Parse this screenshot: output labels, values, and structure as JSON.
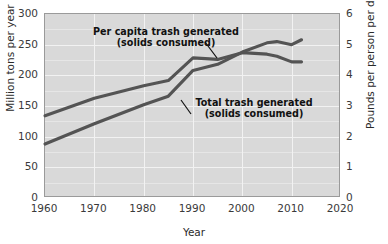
{
  "chart_data": {
    "type": "line",
    "title": "",
    "xlabel": "Year",
    "ylabel": "Million tons per year",
    "ylabel_right": "Pounds per person per day",
    "xlim": [
      1960,
      2020
    ],
    "ylim": [
      0,
      300
    ],
    "ylim_right": [
      0,
      6
    ],
    "grid": true,
    "legend_position": "inline-annotations",
    "xticks": [
      "1960",
      "1970",
      "1980",
      "1990",
      "2000",
      "2010",
      "2020"
    ],
    "yticks_left": [
      "0",
      "50",
      "100",
      "150",
      "200",
      "250",
      "300"
    ],
    "yticks_right": [
      "0",
      "1",
      "2",
      "3",
      "4",
      "5",
      "6"
    ],
    "series": [
      {
        "name": "Per capita trash generated (solids consumed)",
        "axis": "right",
        "units": "Pounds per person per day",
        "x": [
          1960,
          1970,
          1980,
          1985,
          1990,
          1995,
          2000,
          2005,
          2007,
          2010,
          2012
        ],
        "values": [
          2.68,
          3.25,
          3.66,
          3.83,
          4.57,
          4.52,
          4.74,
          4.69,
          4.62,
          4.44,
          4.44
        ]
      },
      {
        "name": "Total trash generated (solids consumed)",
        "axis": "left",
        "units": "Million tons per year",
        "x": [
          1960,
          1970,
          1980,
          1985,
          1990,
          1995,
          2000,
          2005,
          2007,
          2010,
          2012
        ],
        "values": [
          88,
          121,
          152,
          166,
          208,
          218,
          238,
          253,
          255,
          250,
          258
        ]
      }
    ],
    "annotations": [
      {
        "id": "per-capita",
        "text": "Per capita trash generated\n(solids consumed)",
        "series": "Per capita trash generated (solids consumed)"
      },
      {
        "id": "total",
        "text": "Total trash generated\n(solids consumed)",
        "series": "Total trash generated (solids consumed)"
      }
    ],
    "colors": {
      "plot_background": "#d9d9d9",
      "gridline": "#f2f2f2",
      "curve": "#545454",
      "frame": "#9a9a9a",
      "text": "#2b2b2b"
    }
  }
}
